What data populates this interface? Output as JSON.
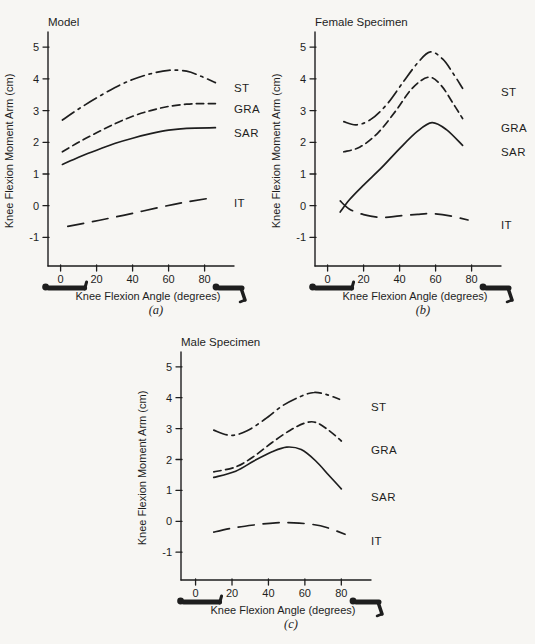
{
  "figure": {
    "background": "#f7f6f3",
    "ink": "#1e1e1e",
    "icons": {
      "left_figure": "person-lying-supine-icon",
      "right_figure": "person-knee-flexed-icon"
    }
  },
  "chart_data": [
    {
      "type": "line",
      "panel_id": "a",
      "title": "Model",
      "caption": "(a)",
      "xlabel": "Knee Flexion Angle (degrees)",
      "ylabel": "Knee Flexion Moment Arm (cm)",
      "xlim": [
        -7,
        93
      ],
      "ylim": [
        -1.9,
        5.35
      ],
      "xticks": [
        0,
        20,
        40,
        60,
        80
      ],
      "yticks": [
        5,
        4,
        3,
        2,
        1,
        0,
        -1
      ],
      "grid": false,
      "legend_position": "right-of-line-ends",
      "series": [
        {
          "name": "ST",
          "line_style": "dashdot",
          "label_y": 3.7,
          "points": [
            [
              1,
              2.7
            ],
            [
              10,
              3.05
            ],
            [
              20,
              3.4
            ],
            [
              30,
              3.72
            ],
            [
              40,
              3.98
            ],
            [
              50,
              4.16
            ],
            [
              60,
              4.27
            ],
            [
              70,
              4.24
            ],
            [
              78,
              4.08
            ],
            [
              86,
              3.88
            ]
          ]
        },
        {
          "name": "GRA",
          "line_style": "dashed",
          "label_y": 3.05,
          "points": [
            [
              1,
              1.7
            ],
            [
              10,
              2.0
            ],
            [
              20,
              2.3
            ],
            [
              30,
              2.58
            ],
            [
              40,
              2.82
            ],
            [
              50,
              3.0
            ],
            [
              60,
              3.13
            ],
            [
              70,
              3.2
            ],
            [
              78,
              3.22
            ],
            [
              86,
              3.22
            ]
          ]
        },
        {
          "name": "SAR",
          "line_style": "solid",
          "label_y": 2.3,
          "points": [
            [
              1,
              1.3
            ],
            [
              10,
              1.53
            ],
            [
              20,
              1.75
            ],
            [
              30,
              1.96
            ],
            [
              40,
              2.13
            ],
            [
              50,
              2.27
            ],
            [
              60,
              2.38
            ],
            [
              70,
              2.44
            ],
            [
              86,
              2.46
            ]
          ]
        },
        {
          "name": "IT",
          "line_style": "longdash",
          "label_y": 0.1,
          "points": [
            [
              4,
              -0.65
            ],
            [
              15,
              -0.53
            ],
            [
              25,
              -0.42
            ],
            [
              40,
              -0.24
            ],
            [
              55,
              -0.05
            ],
            [
              68,
              0.1
            ],
            [
              81,
              0.22
            ]
          ]
        }
      ]
    },
    {
      "type": "line",
      "panel_id": "b",
      "title": "Female Specimen",
      "caption": "(b)",
      "xlabel": "Knee Flexion Angle (degrees)",
      "ylabel": "Knee Flexion Moment Arm (cm)",
      "xlim": [
        -7,
        93
      ],
      "ylim": [
        -1.9,
        5.35
      ],
      "xticks": [
        0,
        20,
        40,
        60,
        80
      ],
      "yticks": [
        5,
        4,
        3,
        2,
        1,
        0,
        -1
      ],
      "grid": false,
      "legend_position": "right-of-line-ends",
      "series": [
        {
          "name": "ST",
          "line_style": "dashdot",
          "label_y": 3.6,
          "points": [
            [
              9,
              2.65
            ],
            [
              16,
              2.55
            ],
            [
              24,
              2.72
            ],
            [
              33,
              3.2
            ],
            [
              42,
              3.9
            ],
            [
              50,
              4.5
            ],
            [
              57,
              4.85
            ],
            [
              64,
              4.62
            ],
            [
              70,
              4.15
            ],
            [
              75,
              3.7
            ]
          ]
        },
        {
          "name": "GRA",
          "line_style": "dashed",
          "label_y": 2.45,
          "points": [
            [
              9,
              1.7
            ],
            [
              18,
              1.85
            ],
            [
              28,
              2.3
            ],
            [
              38,
              3.0
            ],
            [
              47,
              3.7
            ],
            [
              56,
              4.05
            ],
            [
              63,
              3.8
            ],
            [
              70,
              3.2
            ],
            [
              75,
              2.75
            ]
          ]
        },
        {
          "name": "SAR",
          "line_style": "solid",
          "label_y": 1.7,
          "points": [
            [
              7,
              -0.2
            ],
            [
              12,
              0.18
            ],
            [
              20,
              0.65
            ],
            [
              30,
              1.2
            ],
            [
              40,
              1.8
            ],
            [
              50,
              2.35
            ],
            [
              58,
              2.62
            ],
            [
              66,
              2.4
            ],
            [
              75,
              1.9
            ]
          ]
        },
        {
          "name": "IT",
          "line_style": "longdash",
          "label_y": -0.6,
          "points": [
            [
              7,
              0.15
            ],
            [
              12,
              -0.1
            ],
            [
              20,
              -0.28
            ],
            [
              30,
              -0.37
            ],
            [
              40,
              -0.32
            ],
            [
              50,
              -0.27
            ],
            [
              58,
              -0.25
            ],
            [
              68,
              -0.32
            ],
            [
              78,
              -0.45
            ]
          ]
        }
      ]
    },
    {
      "type": "line",
      "panel_id": "c",
      "title": "Male Specimen",
      "caption": "(c)",
      "xlabel": "Knee Flexion Angle (degrees)",
      "ylabel": "Knee Flexion Moment Arm (cm)",
      "xlim": [
        -8,
        93
      ],
      "ylim": [
        -1.9,
        5.35
      ],
      "xticks": [
        0,
        20,
        40,
        60,
        80
      ],
      "yticks": [
        5,
        4,
        3,
        2,
        1,
        0,
        -1
      ],
      "grid": false,
      "legend_position": "right-of-line-ends",
      "series": [
        {
          "name": "ST",
          "line_style": "dashdot",
          "label_y": 3.7,
          "points": [
            [
              10,
              2.95
            ],
            [
              19,
              2.78
            ],
            [
              28,
              2.92
            ],
            [
              38,
              3.3
            ],
            [
              48,
              3.75
            ],
            [
              58,
              4.05
            ],
            [
              65,
              4.17
            ],
            [
              72,
              4.1
            ],
            [
              79,
              3.95
            ]
          ]
        },
        {
          "name": "GRA",
          "line_style": "dashed",
          "label_y": 2.3,
          "points": [
            [
              10,
              1.6
            ],
            [
              22,
              1.76
            ],
            [
              32,
              2.1
            ],
            [
              42,
              2.55
            ],
            [
              52,
              2.95
            ],
            [
              60,
              3.18
            ],
            [
              66,
              3.2
            ],
            [
              73,
              2.95
            ],
            [
              80,
              2.6
            ]
          ]
        },
        {
          "name": "SAR",
          "line_style": "solid",
          "label_y": 0.8,
          "points": [
            [
              10,
              1.42
            ],
            [
              22,
              1.62
            ],
            [
              32,
              1.95
            ],
            [
              42,
              2.25
            ],
            [
              50,
              2.4
            ],
            [
              58,
              2.32
            ],
            [
              66,
              1.95
            ],
            [
              73,
              1.5
            ],
            [
              80,
              1.05
            ]
          ]
        },
        {
          "name": "IT",
          "line_style": "longdash",
          "label_y": -0.65,
          "points": [
            [
              10,
              -0.35
            ],
            [
              20,
              -0.22
            ],
            [
              32,
              -0.12
            ],
            [
              44,
              -0.05
            ],
            [
              54,
              -0.05
            ],
            [
              64,
              -0.1
            ],
            [
              72,
              -0.2
            ],
            [
              82,
              -0.42
            ]
          ]
        }
      ]
    }
  ]
}
